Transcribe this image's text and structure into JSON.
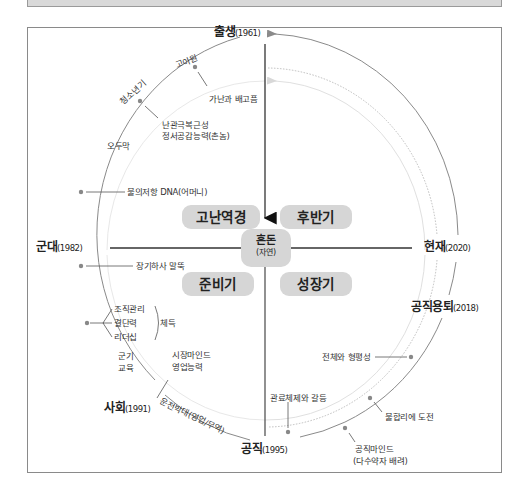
{
  "center": {
    "title": "혼돈",
    "subtitle": "(자연)"
  },
  "phases": [
    {
      "label": "고난역경",
      "quadrant": "top-left"
    },
    {
      "label": "후반기",
      "quadrant": "top-right"
    },
    {
      "label": "준비기",
      "quadrant": "bottom-left"
    },
    {
      "label": "성장기",
      "quadrant": "bottom-right"
    }
  ],
  "milestones": {
    "birth": {
      "name": "출생",
      "year": "(1961)"
    },
    "military": {
      "name": "군대",
      "year": "(1982)"
    },
    "society": {
      "name": "사회",
      "year": "(1991)"
    },
    "public_office": {
      "name": "공직",
      "year": "(1995)"
    },
    "retirement": {
      "name": "공직용퇴",
      "year": "(2018)"
    },
    "present": {
      "name": "현재",
      "year": "(2020)"
    }
  },
  "arc_labels": {
    "orphanage": "고아원",
    "adolescence": "청소년기",
    "odumak": "오두막",
    "military_edu_1": "군기",
    "military_edu_2": "교육",
    "driving_instructor": "운전박대(영업/무역)"
  },
  "annotations": {
    "poverty": "가난과 배고픔",
    "resilience_1": "난관극복근성",
    "resilience_2": "정서공감능력(촌놈)",
    "dna": "불의저항 DNA(어머니)",
    "officer": "장기하사 말뚝",
    "skills_1": "조직관리",
    "skills_2": "결단력",
    "skills_3": "리더십",
    "skills_group": "체득",
    "market_1": "시장마인드",
    "market_2": "영업능력",
    "bureaucracy": "관료체제와 갈등",
    "whole_fair": "전체와 형평성",
    "challenge": "불합리에 도전",
    "public_mind_1": "공직마인드",
    "public_mind_2": "(다수약자 배려)"
  },
  "colors": {
    "phase_bg": "#d6d6d6",
    "arc": "#8a8a8a",
    "arc_light": "#d0d0d0",
    "axis": "#333333"
  }
}
